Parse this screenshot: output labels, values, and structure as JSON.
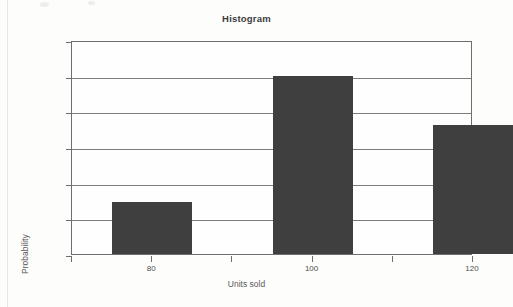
{
  "chart_data": {
    "type": "bar",
    "title": "Histogram",
    "xlabel": "Units sold",
    "ylabel": "Probability",
    "categories": [
      "80",
      "100",
      "120"
    ],
    "values": [
      0.145,
      0.5,
      0.362
    ],
    "series": [
      {
        "name": "Probability",
        "values": [
          0.145,
          0.5,
          0.362
        ]
      }
    ],
    "ylim": [
      0,
      0.6
    ],
    "ytick_labels": [
      "0",
      "0.1",
      "0.2",
      "0.3",
      "0.4",
      "0.5",
      "0.6"
    ],
    "ytick_values": [
      0,
      0.1,
      0.2,
      0.3,
      0.4,
      0.5,
      0.6
    ],
    "xtick_labels": [
      "80",
      "100",
      "120"
    ],
    "xtick_count": 6,
    "grid": true,
    "legend": "none",
    "bar_color": "#3f3f3f",
    "grid_color": "#7c7c7c",
    "axis_color": "#6e6e6e",
    "background_color": "#fdfdfc"
  }
}
